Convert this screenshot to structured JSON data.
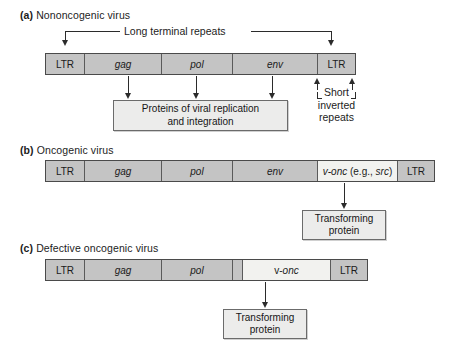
{
  "figure": {
    "panels": [
      {
        "id": "a",
        "tag": "(a)",
        "title": "Nononcogenic virus",
        "bar": {
          "segments": [
            {
              "label": "LTR",
              "style": "plain"
            },
            {
              "label": "gag",
              "style": "italic"
            },
            {
              "label": "pol",
              "style": "italic"
            },
            {
              "label": "env",
              "style": "italic"
            },
            {
              "label": "LTR",
              "style": "plain"
            }
          ]
        },
        "top_annotation": "Long terminal repeats",
        "side_annotation": {
          "line1": "Short",
          "line2": "inverted",
          "line3": "repeats"
        },
        "output_box": {
          "line1": "Proteins of viral replication",
          "line2": "and integration"
        }
      },
      {
        "id": "b",
        "tag": "(b)",
        "title": "Oncogenic virus",
        "bar": {
          "segments": [
            {
              "label": "LTR",
              "style": "plain"
            },
            {
              "label": "gag",
              "style": "italic"
            },
            {
              "label": "pol",
              "style": "italic"
            },
            {
              "label": "env",
              "style": "italic"
            },
            {
              "label": "v-onc (e.g., src)",
              "style": "mixed"
            },
            {
              "label": "LTR",
              "style": "plain"
            }
          ]
        },
        "output_box": {
          "line1": "Transforming",
          "line2": "protein"
        }
      },
      {
        "id": "c",
        "tag": "(c)",
        "title": "Defective oncogenic virus",
        "bar": {
          "segments": [
            {
              "label": "LTR",
              "style": "plain"
            },
            {
              "label": "gag",
              "style": "italic"
            },
            {
              "label": "pol",
              "style": "italic"
            },
            {
              "label": "",
              "style": "blank"
            },
            {
              "label": "v-onc",
              "style": "mixed"
            },
            {
              "label": "LTR",
              "style": "plain"
            }
          ]
        },
        "output_box": {
          "line1": "Transforming",
          "line2": "protein"
        }
      }
    ]
  },
  "colors": {
    "segment_fill": "#c4c4c4",
    "segment_light_fill": "#f2f2ef",
    "box_fill": "#ececeb",
    "stroke": "#4a4a4a",
    "text": "#1a1a1a"
  }
}
